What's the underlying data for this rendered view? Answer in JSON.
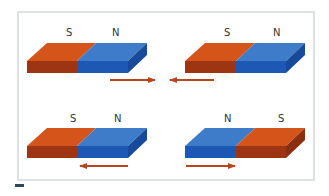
{
  "colors": {
    "south_top": "#d4541a",
    "south_front": "#9e3512",
    "north_top": "#3e7cc9",
    "north_front": "#1d58b4",
    "north_side": "#174a9a",
    "south_side": "#8a2e0e",
    "arrow": "#b8461c",
    "frame": "#dde1e5"
  },
  "panels": [
    {
      "id": "top-left",
      "labels": [
        "S",
        "N"
      ],
      "left_pole": "S",
      "right_pole": "N",
      "arrow": "right"
    },
    {
      "id": "top-right",
      "labels": [
        "S",
        "N"
      ],
      "left_pole": "S",
      "right_pole": "N",
      "arrow": "left"
    },
    {
      "id": "bottom-left",
      "labels": [
        "S",
        "N"
      ],
      "left_pole": "S",
      "right_pole": "N",
      "arrow": "left"
    },
    {
      "id": "bottom-right",
      "labels": [
        "N",
        "S"
      ],
      "left_pole": "N",
      "right_pole": "S",
      "arrow": "right"
    }
  ]
}
